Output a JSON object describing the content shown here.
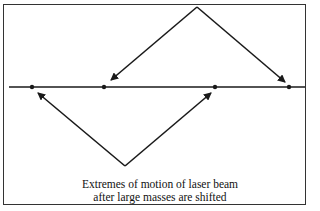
{
  "diagram": {
    "caption_lines": [
      "Extremes of motion of laser beam",
      "after large masses are shifted"
    ],
    "baseline": {
      "x1": 9,
      "x2": 305,
      "y": 87
    },
    "points": [
      {
        "x": 32,
        "y": 87
      },
      {
        "x": 104,
        "y": 87
      },
      {
        "x": 215,
        "y": 87
      },
      {
        "x": 289,
        "y": 87
      }
    ],
    "upper_arrows_apex": {
      "x": 197,
      "y": 7
    },
    "lower_arrows_apex": {
      "x": 125,
      "y": 166
    },
    "colors": {
      "ink": "#1a1a1a",
      "background": "#ffffff"
    }
  }
}
